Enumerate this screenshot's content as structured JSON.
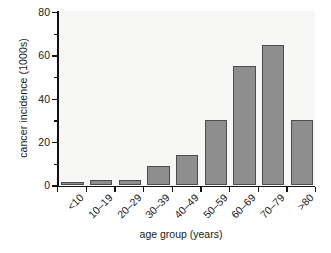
{
  "chart_data": {
    "type": "bar",
    "title": "",
    "xlabel": "age group (years)",
    "ylabel": "cancer incidence (1000s)",
    "categories": [
      "<10",
      "10–19",
      "20–29",
      "30–39",
      "40–49",
      "50–59",
      "60–69",
      "70–79",
      ">80"
    ],
    "values": [
      1.5,
      2.5,
      2.5,
      9,
      14,
      30,
      55,
      65,
      30
    ],
    "ylim": [
      0,
      80
    ],
    "xlim_note": "categorical",
    "ytick_labels": [
      "0",
      "20",
      "40",
      "60",
      "80"
    ],
    "ytick_values": [
      0,
      20,
      40,
      60,
      80
    ],
    "yminor_tick_values": [
      10,
      30,
      50,
      70
    ],
    "grid": false,
    "legend": false,
    "bar_color": "#8e8e8e",
    "bar_edge_color": "#4d4d4d",
    "plot_background": "#f7f7f5",
    "axis_color": "#111111"
  },
  "figure": {
    "caption_sliver": ""
  }
}
